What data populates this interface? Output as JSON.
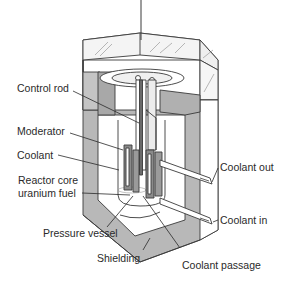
{
  "diagram": {
    "labels": {
      "control_rod": "Control rod",
      "moderator": "Moderator",
      "coolant": "Coolant",
      "reactor_core_line1": "Reactor core",
      "reactor_core_line2": "uranium fuel",
      "pressure_vessel": "Pressure vessel",
      "shielding": "Shielding",
      "coolant_passage": "Coolant passage",
      "coolant_out": "Coolant out",
      "coolant_in": "Coolant in"
    },
    "colors": {
      "shielding_fill": "#b8b8b8",
      "outline": "#3a3a3a",
      "vessel_fill": "#ffffff",
      "fuel_fill": "#8a8a8a",
      "text": "#2a2a2a"
    }
  }
}
